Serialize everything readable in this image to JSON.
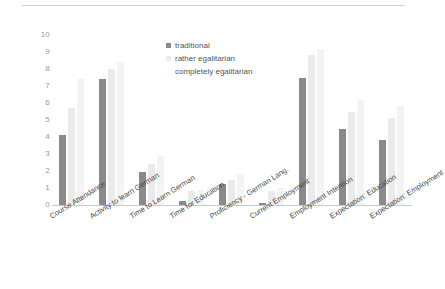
{
  "chart_data": {
    "type": "bar",
    "title": "",
    "subtitle": "",
    "xlabel": "",
    "ylabel": "",
    "ylim": [
      0,
      10
    ],
    "ytick_labels": [
      "10",
      "9",
      "8",
      "7",
      "6",
      "5",
      "4",
      "3",
      "2",
      "1",
      "0"
    ],
    "ytick_values": [
      10,
      9,
      8,
      7,
      6,
      5,
      4,
      3,
      2,
      1,
      0
    ],
    "grid": false,
    "legend_position": "top-center",
    "categories": [
      "Course Attendance",
      "Activity to learn German",
      "Time to Learn German",
      "Time for Education",
      "Proficiency - German Lang.",
      "Current Employment",
      "Employment Intention",
      "Expectation: Education",
      "Expectation: Employment"
    ],
    "series": [
      {
        "name": "traditional",
        "color": "#8a8a8a",
        "values": [
          4.1,
          7.4,
          1.95,
          0.25,
          1.25,
          0.1,
          7.45,
          4.5,
          3.85
        ]
      },
      {
        "name": "rather egalitarian",
        "color": "#eaeaea",
        "values": [
          5.7,
          8.0,
          2.4,
          0.8,
          1.5,
          0.8,
          8.8,
          5.5,
          5.1
        ]
      },
      {
        "name": "completely egalitarian",
        "color": "#f4f4f4",
        "values": [
          7.4,
          8.4,
          2.9,
          0.9,
          1.8,
          1.0,
          9.2,
          6.15,
          5.8
        ]
      }
    ]
  },
  "legend": {
    "items": [
      {
        "label": "traditional",
        "color": "#8a8a8a"
      },
      {
        "label": "rather egalitarian",
        "color": "#eaeaea"
      },
      {
        "label": "completely egalitarian",
        "color": "#fbfbfb"
      }
    ]
  }
}
